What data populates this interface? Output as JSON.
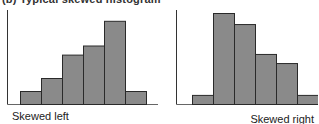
{
  "figure_title": "(b) Typical skewed histogram",
  "chart_data": [
    {
      "type": "bar",
      "title": "Skewed left",
      "caption_align": "left",
      "categories": [
        "1",
        "2",
        "3",
        "4",
        "5",
        "6"
      ],
      "values": [
        1,
        2,
        3.8,
        4.5,
        6.4,
        1
      ],
      "xlabel": "",
      "ylabel": "",
      "ylim": [
        0,
        7
      ],
      "grid": false,
      "bar_color": "#8a8a8a",
      "edge_color": "#2a2a2a"
    },
    {
      "type": "bar",
      "title": "Skewed right",
      "caption_align": "right",
      "categories": [
        "1",
        "2",
        "3",
        "4",
        "5",
        "6"
      ],
      "values": [
        0.7,
        7,
        6.15,
        3.85,
        3.15,
        0.7
      ],
      "xlabel": "",
      "ylabel": "",
      "ylim": [
        0,
        7
      ],
      "grid": false,
      "bar_color": "#8a8a8a",
      "edge_color": "#2a2a2a"
    }
  ]
}
